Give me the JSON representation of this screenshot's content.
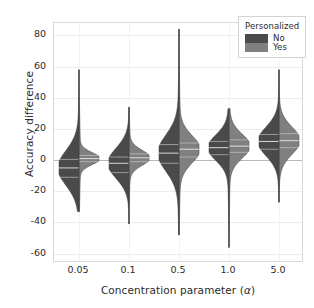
{
  "chart_data": {
    "type": "violin",
    "title": "",
    "xlabel": "Concentration parameter (α)",
    "xlabel_plain": "Concentration parameter (",
    "xlabel_symbol": "α",
    "xlabel_close": ")",
    "ylabel": "Accuracy difference",
    "categories": [
      "0.05",
      "0.1",
      "0.5",
      "1.0",
      "5.0"
    ],
    "ylim": [
      -66,
      88
    ],
    "yticks": [
      80,
      60,
      40,
      20,
      0,
      -20,
      -40,
      -60
    ],
    "ytick_labels": [
      "80",
      "60",
      "40",
      "20",
      "0",
      "-20",
      "-40",
      "-60"
    ],
    "grid": true,
    "split": true,
    "legend": {
      "title": "Personalized",
      "position": "upper-right",
      "entries": [
        {
          "label": "No",
          "color": "#4a4a4a"
        },
        {
          "label": "Yes",
          "color": "#808080"
        }
      ]
    },
    "series": [
      {
        "name": "No",
        "side": "left",
        "color": "#4a4a4a",
        "groups": [
          {
            "category": "0.05",
            "median": -5.0,
            "q1": -11.0,
            "q3": 0.5,
            "min": -33.0,
            "max": 58.0
          },
          {
            "category": "0.1",
            "median": -2.0,
            "q1": -8.0,
            "q3": 2.0,
            "min": -41.0,
            "max": 34.0
          },
          {
            "category": "0.5",
            "median": 4.5,
            "q1": -2.0,
            "q3": 10.0,
            "min": -48.0,
            "max": 84.0
          },
          {
            "category": "1.0",
            "median": 8.0,
            "q1": 3.5,
            "q3": 12.0,
            "min": -56.0,
            "max": 33.0
          },
          {
            "category": "5.0",
            "median": 12.0,
            "q1": 7.0,
            "q3": 16.5,
            "min": -27.0,
            "max": 58.0
          }
        ]
      },
      {
        "name": "Yes",
        "side": "right",
        "color": "#808080",
        "groups": [
          {
            "category": "0.05",
            "median": 1.0,
            "q1": -1.0,
            "q3": 3.0,
            "min": -33.0,
            "max": 58.0
          },
          {
            "category": "0.1",
            "median": 1.5,
            "q1": -1.0,
            "q3": 4.0,
            "min": -41.0,
            "max": 34.0
          },
          {
            "category": "0.5",
            "median": 7.0,
            "q1": 2.0,
            "q3": 11.0,
            "min": -48.0,
            "max": 84.0
          },
          {
            "category": "1.0",
            "median": 9.0,
            "q1": 5.0,
            "q3": 13.0,
            "min": -56.0,
            "max": 33.0
          },
          {
            "category": "5.0",
            "median": 12.5,
            "q1": 8.0,
            "q3": 17.0,
            "min": -27.0,
            "max": 58.0
          }
        ]
      }
    ]
  },
  "figure": {
    "background": "#ffffff",
    "frame_color": "#d8d8d8",
    "grid_color": "#ececec",
    "zero_line_color": "#b9b9b9",
    "text_color": "#2b2b2b"
  }
}
